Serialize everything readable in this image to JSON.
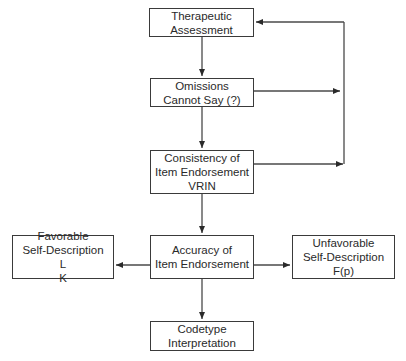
{
  "diagram": {
    "type": "flowchart",
    "colors": {
      "line": "#3a3a3a",
      "text": "#2a2a2a",
      "background": "#ffffff"
    },
    "nodes": {
      "therapeutic": {
        "line1": "Therapeutic",
        "line2": "Assessment"
      },
      "omissions": {
        "line1": "Omissions",
        "line2": "Cannot Say (?)"
      },
      "consistency": {
        "line1": "Consistency of",
        "line2": "Item Endorsement",
        "line3": "VRIN"
      },
      "accuracy": {
        "line1": "Accuracy of",
        "line2": "Item Endorsement"
      },
      "favorable": {
        "line1": "Favorable",
        "line2": "Self-Description",
        "scale_l": "L",
        "scale_k": "K"
      },
      "unfavorable": {
        "line1": "Unfavorable",
        "line2": "Self-Description",
        "line3": "F(p)"
      },
      "codetype": {
        "line1": "Codetype",
        "line2": "Interpretation"
      }
    },
    "edges": [
      {
        "from": "Therapeutic Assessment",
        "to": "Omissions Cannot Say (?)"
      },
      {
        "from": "Omissions Cannot Say (?)",
        "to": "Consistency of Item Endorsement VRIN"
      },
      {
        "from": "Omissions Cannot Say (?)",
        "to": "feedback line to Therapeutic Assessment"
      },
      {
        "from": "Consistency of Item Endorsement VRIN",
        "to": "feedback line to Therapeutic Assessment"
      },
      {
        "from": "Consistency of Item Endorsement VRIN",
        "to": "Accuracy of Item Endorsement"
      },
      {
        "from": "Accuracy of Item Endorsement",
        "to": "Favorable Self-Description L K"
      },
      {
        "from": "Accuracy of Item Endorsement",
        "to": "Unfavorable Self-Description F(p)"
      },
      {
        "from": "Accuracy of Item Endorsement",
        "to": "Codetype Interpretation"
      }
    ]
  }
}
